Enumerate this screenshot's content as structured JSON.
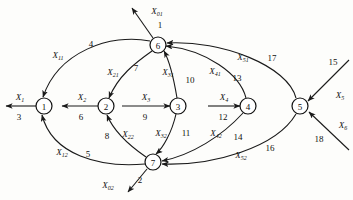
{
  "figure": {
    "type": "directed-graph-signal-flow",
    "width": 353,
    "height": 200,
    "background_color": "#fdfdfb",
    "stroke_color": "#1a1a1a"
  },
  "nodes": [
    {
      "id": "1",
      "label": "1",
      "x": 44,
      "y": 106,
      "r": 8
    },
    {
      "id": "2",
      "label": "2",
      "x": 106,
      "y": 106,
      "r": 8
    },
    {
      "id": "3",
      "label": "3",
      "x": 178,
      "y": 106,
      "r": 8
    },
    {
      "id": "4",
      "label": "4",
      "x": 248,
      "y": 106,
      "r": 8
    },
    {
      "id": "5",
      "label": "5",
      "x": 300,
      "y": 106,
      "r": 8
    },
    {
      "id": "6",
      "label": "6",
      "x": 158,
      "y": 45,
      "r": 8
    },
    {
      "id": "7",
      "label": "7",
      "x": 153,
      "y": 162,
      "r": 8
    }
  ],
  "edges": [
    {
      "id": "e1",
      "from": "6",
      "to": "out-top",
      "var": "X",
      "sub": "01",
      "num": "1"
    },
    {
      "id": "e2",
      "from": "7",
      "to": "out-bottom",
      "var": "X",
      "sub": "02",
      "num": "2"
    },
    {
      "id": "e3",
      "from": "1",
      "to": "out-left",
      "var": "X",
      "sub": "1",
      "num": "3"
    },
    {
      "id": "e4",
      "from": "6",
      "to": "1",
      "var": "X",
      "sub": "11",
      "num": "4"
    },
    {
      "id": "e5",
      "from": "7",
      "to": "1",
      "var": "X",
      "sub": "12",
      "num": "5"
    },
    {
      "id": "e6",
      "from": "2",
      "to": "1",
      "var": "X",
      "sub": "2",
      "num": "6"
    },
    {
      "id": "e7",
      "from": "6",
      "to": "2",
      "var": "X",
      "sub": "21",
      "num": "7"
    },
    {
      "id": "e8",
      "from": "7",
      "to": "2",
      "var": "X",
      "sub": "22",
      "num": "8"
    },
    {
      "id": "e9",
      "from": "2",
      "to": "3",
      "var": "X",
      "sub": "3",
      "num": "9"
    },
    {
      "id": "e10",
      "from": "3",
      "to": "6",
      "var": "X",
      "sub": "31",
      "num": "10"
    },
    {
      "id": "e11",
      "from": "3",
      "to": "7",
      "var": "X",
      "sub": "32",
      "num": "11"
    },
    {
      "id": "e12",
      "from": "3",
      "to": "4",
      "var": "X",
      "sub": "4",
      "num": "12"
    },
    {
      "id": "e13",
      "from": "4",
      "to": "6",
      "var": "X",
      "sub": "41",
      "num": "13"
    },
    {
      "id": "e14",
      "from": "4",
      "to": "7",
      "var": "X",
      "sub": "42",
      "num": "14"
    },
    {
      "id": "e15",
      "from": "in-upper-right",
      "to": "5",
      "var": "X",
      "sub": "5",
      "num": "15"
    },
    {
      "id": "e16",
      "from": "5",
      "to": "7",
      "var": "X",
      "sub": "52",
      "num": "16"
    },
    {
      "id": "e17",
      "from": "5",
      "to": "6",
      "var": "X",
      "sub": "51",
      "num": "17"
    },
    {
      "id": "e18",
      "from": "in-lower-right",
      "to": "5",
      "var": "X",
      "sub": "6",
      "num": "18"
    }
  ]
}
